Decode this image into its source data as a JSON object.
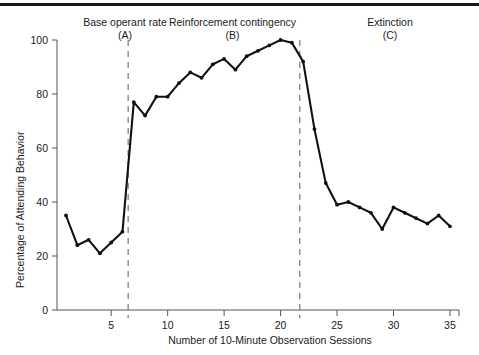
{
  "figure": {
    "has_top_rule": true,
    "line_color": "#111111",
    "divider_color": "#777777",
    "axis_color": "#555555",
    "marker_color": "#111111"
  },
  "phases": [
    {
      "id": "A",
      "name": "Base operant rate",
      "paren": "(A)",
      "start": 1,
      "end": 6
    },
    {
      "id": "B",
      "name": "Reinforcement contingency",
      "paren": "(B)",
      "start": 7,
      "end": 21
    },
    {
      "id": "C",
      "name": "Extinction",
      "paren": "(C)",
      "start": 22,
      "end": 35
    }
  ],
  "dividers": [
    6.5,
    21.7
  ],
  "chart_data": {
    "type": "line",
    "title": "",
    "xlabel": "Number of 10-Minute Observation Sessions",
    "ylabel": "Percentage of Attending Behavior",
    "xlim": [
      0.2,
      35.8
    ],
    "ylim": [
      0,
      100
    ],
    "xticks": [
      5,
      10,
      15,
      20,
      25,
      30,
      35
    ],
    "yticks": [
      0,
      20,
      40,
      60,
      80,
      100
    ],
    "grid": false,
    "legend": "none",
    "x": [
      1,
      2,
      3,
      4,
      5,
      6,
      7,
      8,
      9,
      10,
      11,
      12,
      13,
      14,
      15,
      16,
      17,
      18,
      19,
      20,
      21,
      22,
      23,
      24,
      25,
      26,
      27,
      28,
      29,
      30,
      31,
      32,
      33,
      34,
      35
    ],
    "values": [
      35,
      24,
      26,
      21,
      25,
      29,
      77,
      72,
      79,
      79,
      84,
      88,
      86,
      91,
      93,
      89,
      94,
      96,
      98,
      100,
      99,
      92,
      67,
      47,
      39,
      40,
      38,
      36,
      30,
      38,
      36,
      34,
      32,
      35,
      31
    ],
    "series": [
      {
        "name": "Percentage of Attending Behavior",
        "values": [
          35,
          24,
          26,
          21,
          25,
          29,
          77,
          72,
          79,
          79,
          84,
          88,
          86,
          91,
          93,
          89,
          94,
          96,
          98,
          100,
          99,
          92,
          67,
          47,
          39,
          40,
          38,
          36,
          30,
          38,
          36,
          34,
          32,
          35,
          31
        ]
      }
    ],
    "annotations": [
      {
        "text": "Base operant rate (A)",
        "x_range": [
          1,
          6.5
        ]
      },
      {
        "text": "Reinforcement contingency (B)",
        "x_range": [
          6.5,
          21.7
        ]
      },
      {
        "text": "Extinction (C)",
        "x_range": [
          21.7,
          35
        ]
      }
    ]
  }
}
